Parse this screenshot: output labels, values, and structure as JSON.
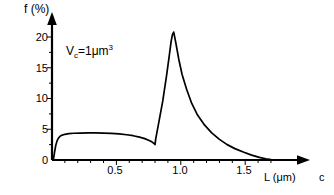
{
  "figure": {
    "panel_label": "c",
    "annotation": {
      "var": "V",
      "sub": "c",
      "eq": "=1μm",
      "sup": "3",
      "full": "Vc=1μm3"
    },
    "colors": {
      "curve": "#000000",
      "axis": "#000000",
      "background": "#ffffff"
    }
  },
  "chart_data": {
    "type": "line",
    "title": "",
    "subtitle": "",
    "xlabel": "L (μm)",
    "ylabel": "f (%)",
    "xlim": [
      0,
      1.78
    ],
    "ylim": [
      0,
      22.5
    ],
    "grid": false,
    "legend": null,
    "xticks_major": [
      0.5,
      1.0,
      1.5
    ],
    "xtick_labels": [
      "0.5",
      "1.0",
      "1.5"
    ],
    "xticks_minor_step": 0.1,
    "yticks_major": [
      0,
      5,
      10,
      15,
      20
    ],
    "ytick_labels": [
      "0",
      "5",
      "10",
      "15",
      "20"
    ],
    "yticks_minor_step": 2.5,
    "annotations": [
      {
        "text": "Vc=1μm3",
        "x": 0.33,
        "y": 17.2
      }
    ],
    "series": [
      {
        "name": "f(L)",
        "x": [
          0.01,
          0.02,
          0.03,
          0.04,
          0.05,
          0.065,
          0.08,
          0.1,
          0.13,
          0.17,
          0.22,
          0.28,
          0.34,
          0.4,
          0.46,
          0.52,
          0.58,
          0.63,
          0.68,
          0.72,
          0.75,
          0.775,
          0.795,
          0.8,
          0.805,
          0.83,
          0.86,
          0.89,
          0.91,
          0.925,
          0.935,
          0.945,
          0.96,
          0.985,
          1.01,
          1.045,
          1.085,
          1.13,
          1.18,
          1.24,
          1.3,
          1.36,
          1.42,
          1.49,
          1.55,
          1.61,
          1.66,
          1.7
        ],
        "y": [
          0.0,
          1.3,
          2.45,
          3.15,
          3.55,
          3.9,
          4.05,
          4.18,
          4.28,
          4.35,
          4.38,
          4.4,
          4.4,
          4.38,
          4.33,
          4.24,
          4.1,
          3.95,
          3.72,
          3.48,
          3.22,
          2.95,
          2.65,
          2.5,
          3.4,
          6.2,
          9.6,
          13.8,
          16.9,
          19.3,
          20.4,
          20.8,
          19.2,
          16.3,
          13.9,
          11.5,
          9.2,
          7.3,
          5.8,
          4.4,
          3.35,
          2.5,
          1.85,
          1.25,
          0.8,
          0.42,
          0.18,
          0.05
        ]
      }
    ],
    "features": {
      "plateau_value": 4.4,
      "plateau_range": [
        0.13,
        0.46
      ],
      "local_min_value": 2.5,
      "local_min_x": 0.8,
      "discontinuity_x": 0.8,
      "peak_value": 20.8,
      "peak_x": 0.945,
      "tail_end_x": 1.7
    }
  }
}
